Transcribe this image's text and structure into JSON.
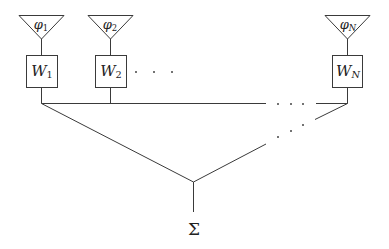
{
  "diagram": {
    "type": "antenna array beamformer (weighted sum)",
    "elements": [
      {
        "id": "1",
        "antenna_label": "φ",
        "antenna_sub": "1",
        "weight_label": "W",
        "weight_sub": "1"
      },
      {
        "id": "2",
        "antenna_label": "φ",
        "antenna_sub": "2",
        "weight_label": "W",
        "weight_sub": "2"
      },
      {
        "id": "N",
        "antenna_label": "φ",
        "antenna_sub": "N",
        "weight_label": "W",
        "weight_sub": "N"
      }
    ],
    "ellipsis": "· · ·",
    "output_label": "Σ",
    "colors": {
      "line": "#3a3a3a",
      "text": "#222222",
      "background": "#ffffff"
    }
  }
}
